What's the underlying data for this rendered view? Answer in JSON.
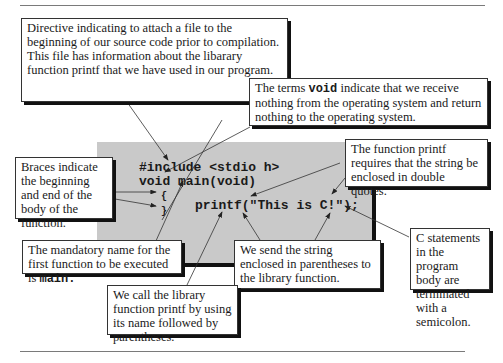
{
  "code": {
    "lines": [
      "#include <stdio h>",
      "void main(void)",
      "{",
      "}",
      "printf(\"This is C!\");"
    ]
  },
  "callouts": {
    "include_directive": {
      "text": "Directive indicating to attach a file to the beginning of our source code prior to compilation. This file has information about the libarary function printf that we have used in our program."
    },
    "void_terms": {
      "pre": "The terms ",
      "keyword": "void",
      "post": " indicate that we receive nothing from the operating system and return nothing to the operating system."
    },
    "braces": {
      "text": "Braces indicate the beginning and end of the body of the function."
    },
    "double_quotes": {
      "text": "The function printf requires that the string be enclosed in double quotes."
    },
    "main_name": {
      "pre": "The mandatory name for the first function to be executed is ",
      "keyword": "main."
    },
    "parentheses": {
      "text": "We send the string enclosed in parentheses to the library function."
    },
    "semicolon": {
      "text": "C statements in the program body are terminated with a semicolon."
    },
    "call_function": {
      "text": "We call the library function printf by using its name followed by parentheses."
    }
  },
  "colors": {
    "code_panel": "#c9c9c9",
    "shadow": "#111111",
    "rule": "#7a7a7a"
  }
}
